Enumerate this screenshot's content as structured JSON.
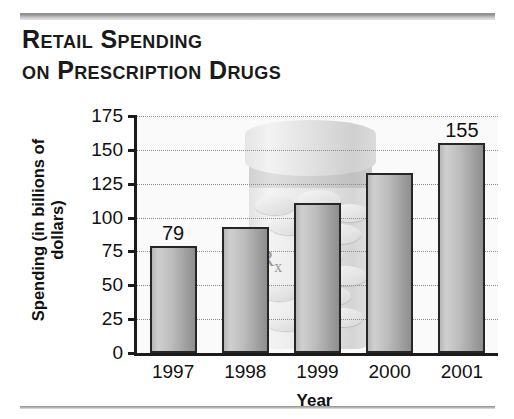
{
  "title": {
    "line1": "Retail Spending",
    "line2": "on Prescription Drugs"
  },
  "watermark": {
    "rx_symbol": "R",
    "rx_subscript": "x",
    "icon": "pill-bottle-icon"
  },
  "chart_data": {
    "type": "bar",
    "title": "Retail Spending on Prescription Drugs",
    "xlabel": "Year",
    "ylabel": "Spending (in billions of dollars)",
    "categories": [
      "1997",
      "1998",
      "1999",
      "2000",
      "2001"
    ],
    "values": [
      79,
      93,
      111,
      133,
      155
    ],
    "value_labels": [
      "79",
      "",
      "",
      "",
      "155"
    ],
    "ylim": [
      0,
      175
    ],
    "ytick_values": [
      0,
      25,
      50,
      75,
      100,
      125,
      150,
      175
    ],
    "ytick_labels": [
      "0",
      "25",
      "50",
      "75",
      "100",
      "125",
      "150",
      "175"
    ],
    "grid": true,
    "legend": false,
    "bar_color": "#bdbdbd",
    "bar_border_color": "#262626",
    "accent_color": "#8e8e8e"
  }
}
